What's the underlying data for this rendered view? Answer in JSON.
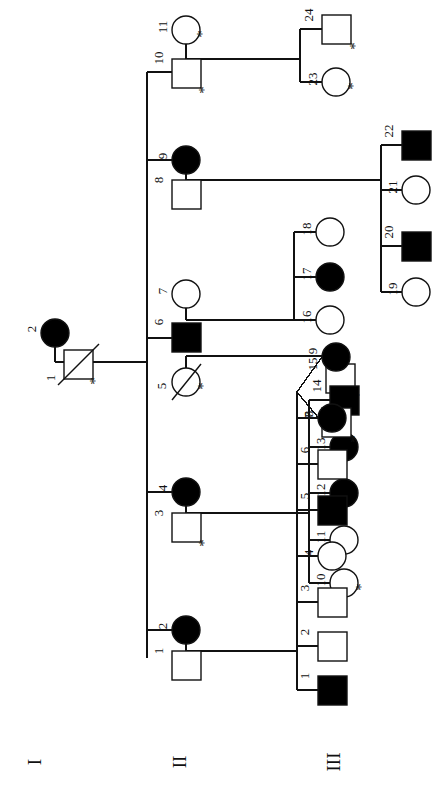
{
  "diagram": {
    "orientation": "rotated-90",
    "generation_labels": [
      {
        "name": "generation-I",
        "text": "I"
      },
      {
        "name": "generation-II",
        "text": "II"
      },
      {
        "name": "generation-III",
        "text": "III"
      }
    ],
    "legend": {
      "filled": "affected",
      "open": "unaffected",
      "slash": "deceased",
      "asterisk": "*"
    },
    "generations": [
      {
        "roman": "I",
        "individuals": [
          {
            "id": "1",
            "sex": "male",
            "affected": false,
            "deceased": true,
            "asterisk": true
          },
          {
            "id": "2",
            "sex": "female",
            "affected": true,
            "deceased": false,
            "asterisk": false
          }
        ]
      },
      {
        "roman": "II",
        "individuals": [
          {
            "id": "1",
            "sex": "male",
            "affected": false,
            "deceased": false,
            "asterisk": false
          },
          {
            "id": "2",
            "sex": "female",
            "affected": true,
            "deceased": false,
            "asterisk": false
          },
          {
            "id": "3",
            "sex": "male",
            "affected": false,
            "deceased": false,
            "asterisk": true
          },
          {
            "id": "4",
            "sex": "female",
            "affected": true,
            "deceased": false,
            "asterisk": false
          },
          {
            "id": "5",
            "sex": "female",
            "affected": false,
            "deceased": true,
            "asterisk": true
          },
          {
            "id": "6",
            "sex": "male",
            "affected": true,
            "deceased": false,
            "asterisk": false
          },
          {
            "id": "7",
            "sex": "female",
            "affected": false,
            "deceased": false,
            "asterisk": false
          },
          {
            "id": "8",
            "sex": "male",
            "affected": false,
            "deceased": false,
            "asterisk": false
          },
          {
            "id": "9",
            "sex": "female",
            "affected": true,
            "deceased": false,
            "asterisk": false
          },
          {
            "id": "10",
            "sex": "male",
            "affected": false,
            "deceased": false,
            "asterisk": true
          },
          {
            "id": "11",
            "sex": "female",
            "affected": false,
            "deceased": false,
            "asterisk": true
          }
        ]
      },
      {
        "roman": "III",
        "individuals": [
          {
            "id": "1",
            "sex": "male",
            "affected": true,
            "deceased": false,
            "asterisk": false
          },
          {
            "id": "2",
            "sex": "male",
            "affected": false,
            "deceased": false,
            "asterisk": false
          },
          {
            "id": "3",
            "sex": "male",
            "affected": false,
            "deceased": false,
            "asterisk": false
          },
          {
            "id": "4",
            "sex": "female",
            "affected": false,
            "deceased": false,
            "asterisk": false
          },
          {
            "id": "5",
            "sex": "male",
            "affected": true,
            "deceased": false,
            "asterisk": false
          },
          {
            "id": "6",
            "sex": "male",
            "affected": false,
            "deceased": false,
            "asterisk": false
          },
          {
            "id": "7",
            "sex": "female",
            "affected": true,
            "deceased": false,
            "asterisk": false
          },
          {
            "id": "8",
            "sex": "male",
            "affected": false,
            "deceased": false,
            "asterisk": true,
            "twin": true
          },
          {
            "id": "9",
            "sex": "female",
            "affected": true,
            "deceased": false,
            "asterisk": false,
            "twin": true
          },
          {
            "id": "10",
            "sex": "female",
            "affected": false,
            "deceased": false,
            "asterisk": true
          },
          {
            "id": "11",
            "sex": "female",
            "affected": false,
            "deceased": false,
            "asterisk": false
          },
          {
            "id": "12",
            "sex": "female",
            "affected": true,
            "deceased": false,
            "asterisk": false
          },
          {
            "id": "13",
            "sex": "female",
            "affected": true,
            "deceased": false,
            "asterisk": false
          },
          {
            "id": "14",
            "sex": "male",
            "affected": true,
            "deceased": false,
            "asterisk": false
          },
          {
            "id": "15",
            "sex": "male",
            "affected": false,
            "deceased": false,
            "asterisk": true
          },
          {
            "id": "16",
            "sex": "female",
            "affected": false,
            "deceased": false,
            "asterisk": false
          },
          {
            "id": "17",
            "sex": "female",
            "affected": true,
            "deceased": false,
            "asterisk": false
          },
          {
            "id": "18",
            "sex": "female",
            "affected": false,
            "deceased": false,
            "asterisk": false
          },
          {
            "id": "19",
            "sex": "female",
            "affected": false,
            "deceased": false,
            "asterisk": false
          },
          {
            "id": "20",
            "sex": "male",
            "affected": true,
            "deceased": false,
            "asterisk": false
          },
          {
            "id": "21",
            "sex": "female",
            "affected": false,
            "deceased": false,
            "asterisk": false
          },
          {
            "id": "22",
            "sex": "male",
            "affected": true,
            "deceased": false,
            "asterisk": false
          },
          {
            "id": "23",
            "sex": "female",
            "affected": false,
            "deceased": false,
            "asterisk": true
          },
          {
            "id": "24",
            "sex": "male",
            "affected": false,
            "deceased": false,
            "asterisk": true
          }
        ]
      }
    ],
    "colors": {
      "stroke": "#111111",
      "affected_fill": "#000000",
      "unaffected_fill": "#ffffff",
      "background": "#ffffff"
    }
  }
}
